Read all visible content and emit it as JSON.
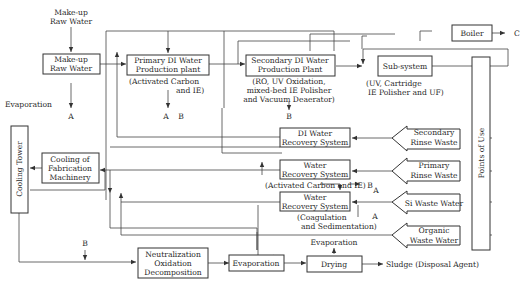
{
  "diagram": {
    "nodes": {
      "makeup_label": [
        "Make-up",
        "Raw Water"
      ],
      "makeup_box": [
        "Make-up",
        "Raw Water"
      ],
      "primary": [
        "Primary DI Water",
        "Production plant"
      ],
      "primary_note": [
        "(Activated Carbon",
        "and IE)"
      ],
      "secondary": [
        "Secondary DI Water",
        "Production Plant"
      ],
      "secondary_note": [
        "(RO, UV Oxidation,",
        "mixed-bed IE Polisher",
        "and Vacuum Deaerator)"
      ],
      "subsystem": "Sub-system",
      "subsystem_note": [
        "(UV, Cartridge",
        "IE Polisher and UF)"
      ],
      "boiler": "Boiler",
      "boiler_out": "C",
      "points_of_use": "Points of Use",
      "evaporation_top": "Evaporation",
      "cooling_tower": "Cooling Tower",
      "cooling_fab": [
        "Cooling of",
        "Fabrication",
        "Machinery"
      ],
      "di_recovery": [
        "DI Water",
        "Recovery System"
      ],
      "water_recovery_1": [
        "Water",
        "Recovery System"
      ],
      "water_recovery_1_note": "(Activated Carbon and IE)",
      "water_recovery_2": [
        "Water",
        "Recovery System"
      ],
      "water_recovery_2_note": [
        "(Coagulation",
        "and Sedimentation)"
      ],
      "secondary_rinse": [
        "Secondary",
        "Rinse Waste"
      ],
      "primary_rinse": [
        "Primary",
        "Rinse Waste"
      ],
      "si_waste": "Si Waste Water",
      "organic_waste": [
        "Organic",
        "Waste Water"
      ],
      "neutralization": [
        "Neutralization",
        "Oxidation",
        "Decomposition"
      ],
      "evaporation_box": "Evaporation",
      "evaporation_drying": "Evaporation",
      "drying": "Drying",
      "sludge": "Sludge (Disposal Agent)"
    },
    "markers": {
      "A": "A",
      "B": "B",
      "C": "C"
    }
  }
}
